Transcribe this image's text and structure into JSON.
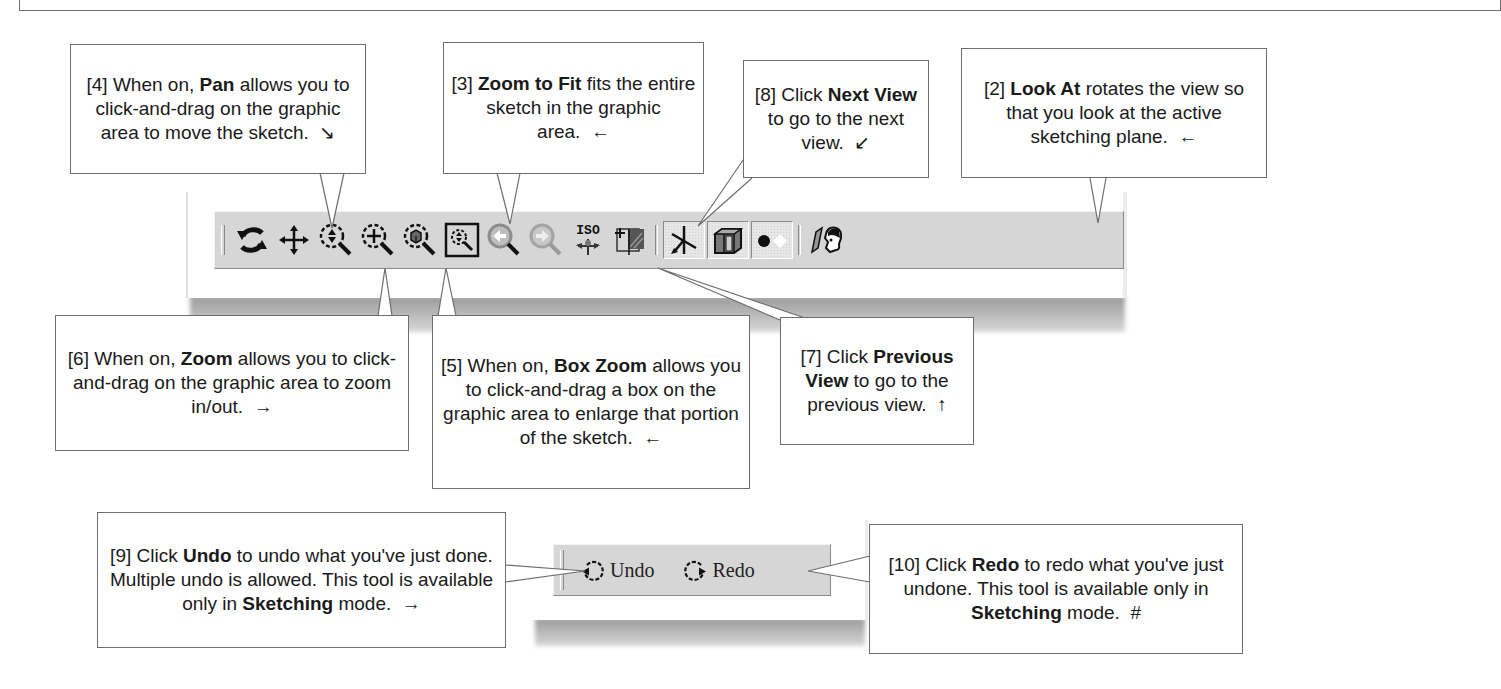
{
  "callouts": {
    "pan": {
      "num": "[4]",
      "pre": " When on, ",
      "bold": "Pan",
      "post": " allows you to click-and-drag on the graphic area to move the sketch.",
      "marker": "↘"
    },
    "zoom_to_fit": {
      "num": "[3]",
      "pre": " ",
      "bold": "Zoom to Fit",
      "post": " fits the entire sketch in the graphic area.",
      "marker": "←"
    },
    "next_view": {
      "num": "[8]",
      "pre": " Click ",
      "bold": "Next View",
      "post": " to go to the next view.",
      "marker": "↙"
    },
    "look_at": {
      "num": "[2]",
      "pre": " ",
      "bold": "Look At",
      "post": " rotates the view so that you look at the active sketching plane.",
      "marker": "←"
    },
    "zoom": {
      "num": "[6]",
      "pre": " When on, ",
      "bold": "Zoom",
      "post": " allows you to click-and-drag on the graphic area to zoom in/out.",
      "marker": "→"
    },
    "box_zoom": {
      "num": "[5]",
      "pre": " When on, ",
      "bold": "Box Zoom",
      "post": " allows you to click-and-drag a box on the graphic area to enlarge that portion of the sketch.",
      "marker": "←"
    },
    "previous_view": {
      "num": "[7]",
      "pre": " Click ",
      "bold": "Previous View",
      "post": " to go to the previous view.",
      "marker": "↑"
    },
    "undo": {
      "num": "[9]",
      "pre": " Click ",
      "bold": "Undo",
      "post": " to undo what you've just done.  Multiple undo is allowed. This tool is available only in ",
      "bold2": "Sketching",
      "post2": " mode.",
      "marker": "→"
    },
    "redo": {
      "num": "[10]",
      "pre": " Click ",
      "bold": "Redo",
      "post": " to redo what you've just undone. This tool is available only in ",
      "bold2": "Sketching",
      "post2": " mode.",
      "marker": "#"
    }
  },
  "view_toolbar": {
    "buttons": [
      {
        "id": "rotate",
        "icon": "rotate-icon"
      },
      {
        "id": "pan",
        "icon": "pan-icon"
      },
      {
        "id": "zoom",
        "icon": "zoom-icon"
      },
      {
        "id": "box_zoom",
        "icon": "box-zoom-icon"
      },
      {
        "id": "zoom_to_fit",
        "icon": "zoom-to-fit-icon"
      },
      {
        "id": "zoom_to_selected",
        "icon": "zoom-to-selected-icon"
      },
      {
        "id": "previous_view",
        "icon": "previous-view-icon"
      },
      {
        "id": "next_view",
        "icon": "next-view-icon"
      },
      {
        "id": "iso_view",
        "icon": "iso-view-icon",
        "label": "ISO"
      },
      {
        "id": "new_sketch",
        "icon": "new-sketch-icon"
      },
      {
        "id": "display_triad",
        "icon": "triad-icon",
        "pressed": true
      },
      {
        "id": "display_model",
        "icon": "model-icon",
        "pressed": true
      },
      {
        "id": "display_points",
        "icon": "points-icon",
        "pressed": true
      },
      {
        "id": "look_at",
        "icon": "look-at-icon"
      }
    ]
  },
  "undo_toolbar": {
    "undo_label": "Undo",
    "redo_label": "Redo"
  }
}
